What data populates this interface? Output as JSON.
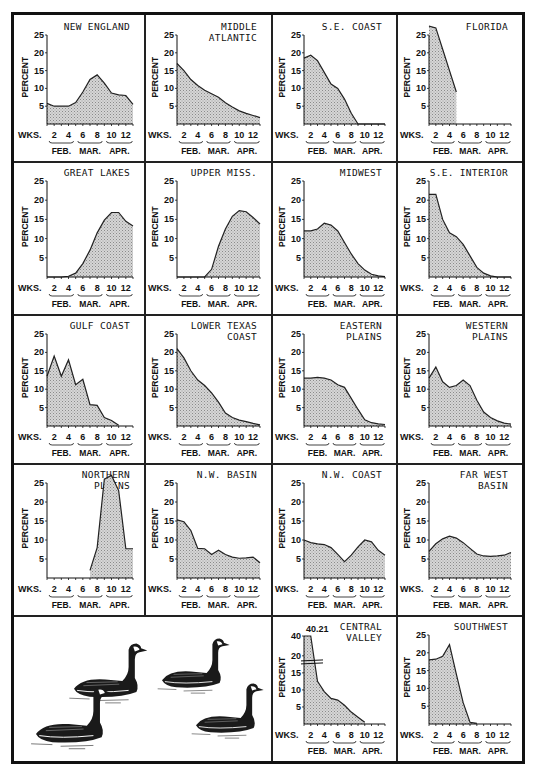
{
  "figure": {
    "fill_color": "#c9c9c9",
    "line_color": "#222222",
    "x_axis_label": "WKS.",
    "y_axis_label": "PERCENT",
    "x_ticks": [
      "2",
      "4",
      "6",
      "8",
      "10",
      "12"
    ],
    "months": [
      "FEB.",
      "MAR.",
      "APR."
    ],
    "illustration": "canada-geese-drawing"
  },
  "chart_data": [
    {
      "type": "area",
      "title": "NEW ENGLAND",
      "title_lines": [
        "NEW ENGLAND"
      ],
      "xlabel": "WKS.",
      "ylabel": "PERCENT",
      "ylim": [
        0,
        25
      ],
      "yticks": [
        5,
        10,
        15,
        20,
        25
      ],
      "x": [
        1,
        2,
        3,
        4,
        5,
        6,
        7,
        8,
        9,
        10,
        11,
        12,
        13
      ],
      "values": [
        5.8,
        5.0,
        5.0,
        5.0,
        6.0,
        9.0,
        12.5,
        13.8,
        11.5,
        8.7,
        8.2,
        8.0,
        5.5
      ]
    },
    {
      "type": "area",
      "title": "MIDDLE ATLANTIC",
      "title_lines": [
        "MIDDLE",
        "ATLANTIC"
      ],
      "xlabel": "WKS.",
      "ylabel": "PERCENT",
      "ylim": [
        0,
        25
      ],
      "yticks": [
        5,
        10,
        15,
        20,
        25
      ],
      "x": [
        1,
        2,
        3,
        4,
        5,
        6,
        7,
        8,
        9,
        10,
        11,
        12,
        13
      ],
      "values": [
        17.0,
        15.0,
        12.5,
        10.8,
        9.5,
        8.5,
        7.5,
        6.0,
        4.8,
        3.7,
        3.0,
        2.4,
        1.8
      ]
    },
    {
      "type": "area",
      "title": "S.E. COAST",
      "title_lines": [
        "S.E. COAST"
      ],
      "xlabel": "WKS.",
      "ylabel": "PERCENT",
      "ylim": [
        0,
        25
      ],
      "yticks": [
        5,
        10,
        15,
        20,
        25
      ],
      "x": [
        1,
        2,
        3,
        4,
        5,
        6,
        7,
        8,
        9,
        10,
        11,
        12,
        13
      ],
      "values": [
        18.5,
        19.3,
        17.8,
        14.5,
        11.2,
        10.0,
        7.0,
        3.0,
        0,
        0,
        0,
        0,
        0
      ]
    },
    {
      "type": "area",
      "title": "FLORIDA",
      "title_lines": [
        "FLORIDA"
      ],
      "xlabel": "WKS.",
      "ylabel": "PERCENT",
      "ylim": [
        0,
        25
      ],
      "yticks": [
        5,
        10,
        15,
        20,
        25
      ],
      "x": [
        1,
        2,
        3,
        4,
        5
      ],
      "values": [
        27.5,
        27.0,
        21.0,
        15.0,
        9.0
      ]
    },
    {
      "type": "area",
      "title": "GREAT LAKES",
      "title_lines": [
        "GREAT LAKES"
      ],
      "xlabel": "WKS.",
      "ylabel": "PERCENT",
      "ylim": [
        0,
        25
      ],
      "yticks": [
        5,
        10,
        15,
        20,
        25
      ],
      "x": [
        1,
        2,
        3,
        4,
        5,
        6,
        7,
        8,
        9,
        10,
        11,
        12,
        13
      ],
      "values": [
        0,
        0,
        0,
        0.2,
        1.0,
        3.5,
        7.0,
        11.5,
        14.8,
        16.8,
        16.8,
        14.5,
        13.3
      ]
    },
    {
      "type": "area",
      "title": "UPPER MISS.",
      "title_lines": [
        "UPPER MISS."
      ],
      "xlabel": "WKS.",
      "ylabel": "PERCENT",
      "ylim": [
        0,
        25
      ],
      "yticks": [
        5,
        10,
        15,
        20,
        25
      ],
      "x": [
        1,
        2,
        3,
        4,
        5,
        6,
        7,
        8,
        9,
        10,
        11,
        12,
        13
      ],
      "values": [
        0,
        0,
        0,
        0,
        0,
        2.0,
        8.0,
        12.5,
        15.8,
        17.3,
        17.0,
        15.5,
        13.8
      ]
    },
    {
      "type": "area",
      "title": "MIDWEST",
      "title_lines": [
        "MIDWEST"
      ],
      "xlabel": "WKS.",
      "ylabel": "PERCENT",
      "ylim": [
        0,
        25
      ],
      "yticks": [
        5,
        10,
        15,
        20,
        25
      ],
      "x": [
        1,
        2,
        3,
        4,
        5,
        6,
        7,
        8,
        9,
        10,
        11,
        12,
        13
      ],
      "values": [
        12.0,
        12.0,
        12.5,
        14.0,
        13.5,
        12.0,
        9.0,
        6.0,
        3.5,
        1.8,
        0.7,
        0.3,
        0.1
      ]
    },
    {
      "type": "area",
      "title": "S.E. INTERIOR",
      "title_lines": [
        "S.E. INTERIOR"
      ],
      "xlabel": "WKS.",
      "ylabel": "PERCENT",
      "ylim": [
        0,
        25
      ],
      "yticks": [
        5,
        10,
        15,
        20,
        25
      ],
      "x": [
        1,
        2,
        3,
        4,
        5,
        6,
        7,
        8,
        9,
        10,
        11,
        12,
        13
      ],
      "values": [
        21.5,
        21.5,
        15.0,
        11.5,
        10.5,
        8.5,
        5.5,
        2.5,
        1.0,
        0.3,
        0,
        0,
        0
      ]
    },
    {
      "type": "area",
      "title": "GULF COAST",
      "title_lines": [
        "GULF COAST"
      ],
      "xlabel": "WKS.",
      "ylabel": "PERCENT",
      "ylim": [
        0,
        25
      ],
      "yticks": [
        5,
        10,
        15,
        20,
        25
      ],
      "x": [
        1,
        2,
        3,
        4,
        5,
        6,
        7,
        8,
        9,
        10,
        11
      ],
      "values": [
        13.5,
        19.0,
        13.5,
        18.0,
        11.2,
        12.7,
        5.8,
        5.6,
        2.3,
        1.5,
        0.2
      ]
    },
    {
      "type": "area",
      "title": "LOWER TEXAS COAST",
      "title_lines": [
        "LOWER TEXAS",
        "COAST"
      ],
      "xlabel": "WKS.",
      "ylabel": "PERCENT",
      "ylim": [
        0,
        25
      ],
      "yticks": [
        5,
        10,
        15,
        20,
        25
      ],
      "x": [
        1,
        2,
        3,
        4,
        5,
        6,
        7,
        8,
        9,
        10,
        11,
        12,
        13
      ],
      "values": [
        21.0,
        18.5,
        15.0,
        12.5,
        11.0,
        9.0,
        6.5,
        3.5,
        2.3,
        1.6,
        1.2,
        0.7,
        0.3
      ]
    },
    {
      "type": "area",
      "title": "EASTERN PLAINS",
      "title_lines": [
        "EASTERN",
        "PLAINS"
      ],
      "xlabel": "WKS.",
      "ylabel": "PERCENT",
      "ylim": [
        0,
        25
      ],
      "yticks": [
        5,
        10,
        15,
        20,
        25
      ],
      "x": [
        1,
        2,
        3,
        4,
        5,
        6,
        7,
        8,
        9,
        10,
        11,
        12,
        13
      ],
      "values": [
        13.0,
        13.0,
        13.2,
        13.0,
        12.5,
        11.2,
        10.5,
        7.5,
        4.5,
        1.7,
        0.9,
        0.6,
        0.4
      ]
    },
    {
      "type": "area",
      "title": "WESTERN PLAINS",
      "title_lines": [
        "WESTERN",
        "PLAINS"
      ],
      "xlabel": "WKS.",
      "ylabel": "PERCENT",
      "ylim": [
        0,
        25
      ],
      "yticks": [
        5,
        10,
        15,
        20,
        25
      ],
      "x": [
        1,
        2,
        3,
        4,
        5,
        6,
        7,
        8,
        9,
        10,
        11,
        12,
        13
      ],
      "values": [
        13.0,
        16.0,
        12.0,
        10.5,
        11.0,
        12.5,
        11.0,
        7.0,
        3.8,
        2.3,
        1.4,
        0.8,
        0.5
      ]
    },
    {
      "type": "area",
      "title": "NORTHERN PLAINS",
      "title_lines": [
        "NORTHERN",
        "PLAINS"
      ],
      "xlabel": "WKS.",
      "ylabel": "PERCENT",
      "ylim": [
        0,
        25
      ],
      "yticks": [
        5,
        10,
        15,
        20,
        25
      ],
      "x": [
        7,
        8,
        9,
        10,
        11,
        12,
        13
      ],
      "values": [
        2.0,
        8.0,
        26.0,
        27.0,
        23.0,
        7.7,
        7.7
      ]
    },
    {
      "type": "area",
      "title": "N.W. BASIN",
      "title_lines": [
        "N.W. BASIN"
      ],
      "xlabel": "WKS.",
      "ylabel": "PERCENT",
      "ylim": [
        0,
        25
      ],
      "yticks": [
        5,
        10,
        15,
        20,
        25
      ],
      "x": [
        1,
        2,
        3,
        4,
        5,
        6,
        7,
        8,
        9,
        10,
        11,
        12,
        13
      ],
      "values": [
        15.3,
        14.8,
        12.5,
        7.8,
        7.7,
        6.2,
        7.3,
        6.2,
        5.5,
        5.2,
        5.3,
        5.5,
        4.0
      ]
    },
    {
      "type": "area",
      "title": "N.W. COAST",
      "title_lines": [
        "N.W. COAST"
      ],
      "xlabel": "WKS.",
      "ylabel": "PERCENT",
      "ylim": [
        0,
        25
      ],
      "yticks": [
        5,
        10,
        15,
        20,
        25
      ],
      "x": [
        1,
        2,
        3,
        4,
        5,
        6,
        7,
        8,
        9,
        10,
        11,
        12,
        13
      ],
      "values": [
        10.0,
        9.3,
        9.0,
        8.8,
        8.0,
        6.2,
        4.3,
        6.0,
        8.2,
        10.0,
        9.5,
        7.3,
        6.0
      ]
    },
    {
      "type": "area",
      "title": "FAR WEST BASIN",
      "title_lines": [
        "FAR WEST",
        "BASIN"
      ],
      "xlabel": "WKS.",
      "ylabel": "PERCENT",
      "ylim": [
        0,
        25
      ],
      "yticks": [
        5,
        10,
        15,
        20,
        25
      ],
      "x": [
        1,
        2,
        3,
        4,
        5,
        6,
        7,
        8,
        9,
        10,
        11,
        12,
        13
      ],
      "values": [
        7.0,
        9.0,
        10.3,
        11.0,
        10.5,
        9.3,
        7.8,
        6.3,
        5.8,
        5.7,
        5.8,
        6.0,
        6.7
      ]
    },
    {
      "type": "area",
      "title": "CENTRAL VALLEY",
      "title_lines": [
        "CENTRAL",
        "VALLEY"
      ],
      "xlabel": "WKS.",
      "ylabel": "PERCENT",
      "ylim": [
        0,
        40
      ],
      "yticks": [
        5,
        10,
        15,
        20,
        40
      ],
      "axis_break": true,
      "annotation": "40.21",
      "x": [
        1,
        2,
        3,
        4,
        5,
        6,
        7,
        8,
        9,
        10
      ],
      "values": [
        40.21,
        40.21,
        12.5,
        9.5,
        7.5,
        7.0,
        5.5,
        3.5,
        2.0,
        0.5
      ]
    },
    {
      "type": "area",
      "title": "SOUTHWEST",
      "title_lines": [
        "SOUTHWEST"
      ],
      "xlabel": "WKS.",
      "ylabel": "PERCENT",
      "ylim": [
        0,
        25
      ],
      "yticks": [
        5,
        10,
        15,
        20,
        25
      ],
      "x": [
        1,
        2,
        3,
        4,
        5,
        6,
        7,
        8
      ],
      "values": [
        18.0,
        18.2,
        19.0,
        22.3,
        14.0,
        6.0,
        0.5,
        0.2
      ]
    }
  ]
}
